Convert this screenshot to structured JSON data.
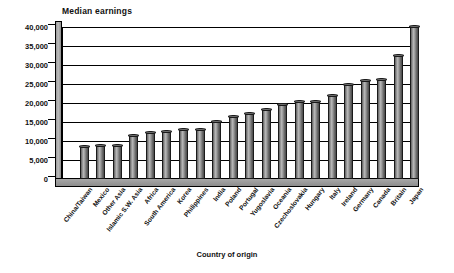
{
  "chart_data": {
    "type": "bar",
    "title": "Median earnings",
    "xlabel": "Country of origin",
    "ylabel": "",
    "ylim": [
      0,
      40000
    ],
    "ytick_labels": [
      "40,000",
      "35,000",
      "30,000",
      "25,000",
      "20,000",
      "15,000",
      "10,000",
      "5,000",
      "0"
    ],
    "ytick_values": [
      40000,
      35000,
      30000,
      25000,
      20000,
      15000,
      10000,
      5000,
      0
    ],
    "grid": true,
    "legend": "none",
    "categories": [
      "China/Taiwan",
      "Mexico",
      "Other Asia",
      "Islamic S.W. Asia",
      "Africa",
      "South America",
      "Korea",
      "Philippines",
      "India",
      "Poland",
      "Portugal",
      "Yugoslavia",
      "Oceania",
      "Czechoslovakia",
      "Hungary",
      "Italy",
      "Ireland",
      "Germany",
      "Canada",
      "Britain",
      "Japan"
    ],
    "values": [
      8600,
      8700,
      8700,
      11500,
      12300,
      12500,
      13000,
      13100,
      15200,
      16500,
      17200,
      18200,
      19600,
      20300,
      20400,
      22000,
      25000,
      25800,
      26300,
      32500,
      40200
    ]
  }
}
